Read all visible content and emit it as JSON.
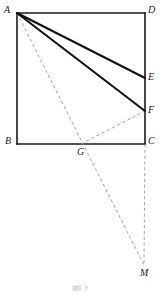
{
  "figure": {
    "caption": "图 2",
    "background_color": "#ffffff",
    "stroke_color": "#1a1a1a",
    "dashed_color": "#9a9a9a",
    "label_color": "#1a1a1a",
    "width": 160,
    "height": 293
  },
  "points": [
    {
      "id": "A",
      "label": "A",
      "x": 17,
      "y": 13,
      "label_x": 4,
      "label_y": 5,
      "on_shape": "square-corner-top-left"
    },
    {
      "id": "D",
      "label": "D",
      "x": 145,
      "y": 13,
      "label_x": 148,
      "label_y": 5,
      "on_shape": "square-corner-top-right"
    },
    {
      "id": "E",
      "label": "E",
      "x": 145,
      "y": 78,
      "label_x": 148,
      "label_y": 72,
      "on_shape": "side-DC"
    },
    {
      "id": "F",
      "label": "F",
      "x": 145,
      "y": 111,
      "label_x": 148,
      "label_y": 105,
      "on_shape": "side-DC"
    },
    {
      "id": "B",
      "label": "B",
      "x": 17,
      "y": 144,
      "label_x": 5,
      "label_y": 136,
      "on_shape": "square-corner-bottom-left"
    },
    {
      "id": "G",
      "label": "G",
      "x": 81,
      "y": 144,
      "label_x": 77,
      "label_y": 147,
      "on_shape": "side-BC"
    },
    {
      "id": "C",
      "label": "C",
      "x": 145,
      "y": 144,
      "label_x": 148,
      "label_y": 136,
      "on_shape": "square-corner-bottom-right"
    },
    {
      "id": "M",
      "label": "M",
      "x": 144,
      "y": 265,
      "label_x": 140,
      "label_y": 268,
      "on_shape": "outside-below"
    }
  ],
  "segments": [
    {
      "id": "AD",
      "from": "A",
      "to": "D",
      "style": "solid",
      "weight": 1.6,
      "color": "#1a1a1a",
      "role": "square-side-top"
    },
    {
      "id": "DC",
      "from": "D",
      "to": "C",
      "style": "solid",
      "weight": 1.6,
      "color": "#1a1a1a",
      "role": "square-side-right"
    },
    {
      "id": "CB",
      "from": "C",
      "to": "B",
      "style": "solid",
      "weight": 1.6,
      "color": "#1a1a1a",
      "role": "square-side-bottom"
    },
    {
      "id": "BA",
      "from": "B",
      "to": "A",
      "style": "solid",
      "weight": 1.6,
      "color": "#1a1a1a",
      "role": "square-side-left"
    },
    {
      "id": "AE",
      "from": "A",
      "to": "E",
      "style": "solid",
      "weight": 2.1,
      "color": "#111111",
      "role": "cevian"
    },
    {
      "id": "AF",
      "from": "A",
      "to": "F",
      "style": "solid",
      "weight": 2.1,
      "color": "#111111",
      "role": "cevian"
    },
    {
      "id": "AM",
      "from": "A",
      "to": "M",
      "style": "dashed",
      "weight": 0.9,
      "color": "#9a9a9a",
      "role": "construction-through-G"
    },
    {
      "id": "GF",
      "from": "G",
      "to": "F",
      "style": "dashed",
      "weight": 0.9,
      "color": "#9a9a9a",
      "role": "construction"
    },
    {
      "id": "CM",
      "from": "C",
      "to": "M",
      "style": "dashed",
      "weight": 0.9,
      "color": "#9a9a9a",
      "role": "construction-vertical"
    }
  ]
}
